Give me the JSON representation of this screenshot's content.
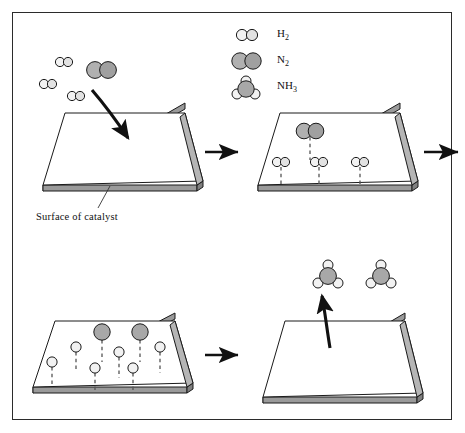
{
  "figure": {
    "background": "#ffffff",
    "border_color": "#2b2b2b"
  },
  "colors": {
    "hydrogen_fill": "#f2f2f2",
    "nitrogen_fill": "#a8a8a8",
    "slab_top_fill": "#ffffff",
    "slab_edge_fill": "#9a9a9a",
    "outline": "#1a1a1a",
    "arrow": "#111111",
    "dash": "#555555"
  },
  "legend": {
    "name": "molecule-key",
    "items": [
      {
        "symbol": "H",
        "sub": "2",
        "glyph": "h2-molecule",
        "atoms": "two small white spheres"
      },
      {
        "symbol": "N",
        "sub": "2",
        "glyph": "n2-molecule",
        "atoms": "two large grey spheres"
      },
      {
        "symbol": "NH",
        "sub": "3",
        "glyph": "nh3-molecule",
        "atoms": "one grey sphere with three white spheres"
      }
    ]
  },
  "labels": {
    "surface_of_catalyst": "Surface of catalyst"
  },
  "panels": [
    {
      "id": "panel-1",
      "name": "panel-adsorption-approach",
      "stage": 1,
      "description": "Hydrogen and nitrogen molecules approach the catalyst surface",
      "free_molecules": {
        "h2_count": 3,
        "n2_count": 1
      },
      "surface_species": {
        "h_atoms": 0,
        "n_atoms": 0,
        "h2_adsorbed": 0,
        "n2_adsorbed": 0
      },
      "arrow": "curved-arrow-down-onto-surface",
      "has_caption": true
    },
    {
      "id": "panel-2",
      "name": "panel-molecules-adsorbed",
      "stage": 2,
      "description": "Molecules adsorb on the catalyst surface, bonds shown dashed",
      "free_molecules": {
        "h2_count": 0,
        "n2_count": 0
      },
      "surface_species": {
        "h2_adsorbed": 3,
        "n2_adsorbed": 1,
        "h_atoms": 0,
        "n_atoms": 0
      },
      "arrow": null,
      "has_caption": false
    },
    {
      "id": "panel-3",
      "name": "panel-bonds-broken",
      "stage": 3,
      "description": "Adsorbed molecules dissociate into atoms on the surface",
      "free_molecules": {
        "h2_count": 0,
        "n2_count": 0
      },
      "surface_species": {
        "h_atoms": 6,
        "n_atoms": 2,
        "h2_adsorbed": 0,
        "n2_adsorbed": 0
      },
      "arrow": null,
      "has_caption": false
    },
    {
      "id": "panel-4",
      "name": "panel-ammonia-released",
      "stage": 4,
      "description": "Ammonia molecules form and leave the catalyst surface",
      "free_molecules": {
        "nh3_count": 2
      },
      "surface_species": {
        "h_atoms": 0,
        "n_atoms": 0
      },
      "arrow": "straight-arrow-up-off-surface",
      "has_caption": false
    }
  ],
  "flow_arrows": [
    {
      "name": "arrow-panel1-to-panel2",
      "direction": "right"
    },
    {
      "name": "arrow-row1-wrap",
      "direction": "right"
    },
    {
      "name": "arrow-panel3-to-panel4",
      "direction": "right"
    }
  ]
}
